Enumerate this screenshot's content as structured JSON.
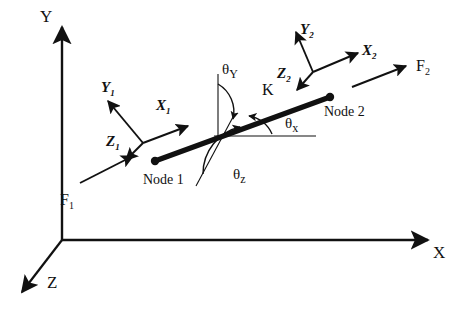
{
  "figure": {
    "kind": "engineering-diagram",
    "background_color": "#ffffff",
    "ink_color": "#111111"
  },
  "global_axes": {
    "x_label": "X",
    "y_label": "Y",
    "z_label": "Z"
  },
  "element": {
    "stiffness_label": "K",
    "node1_label": "Node 1",
    "node2_label": "Node 2"
  },
  "local_frame_node1": {
    "x_label": "X",
    "x_sub": "1",
    "y_label": "Y",
    "y_sub": "1",
    "z_label": "Z",
    "z_sub": "1"
  },
  "local_frame_node2": {
    "x_label": "X",
    "x_sub": "2",
    "y_label": "Y",
    "y_sub": "2",
    "z_label": "Z",
    "z_sub": "2"
  },
  "forces": {
    "f1_label": "F",
    "f1_sub": "1",
    "f2_label": "F",
    "f2_sub": "2"
  },
  "angles": {
    "theta_y_symbol": "θ",
    "theta_y_sub": "Y",
    "theta_x_symbol": "θ",
    "theta_x_sub": "x",
    "theta_z_symbol": "θ",
    "theta_z_sub": "z"
  }
}
